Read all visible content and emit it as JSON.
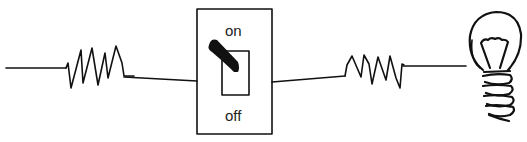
{
  "diagram": {
    "type": "circuit",
    "colors": {
      "line": "#111111",
      "text": "#222222",
      "background": "#ffffff"
    },
    "components": [
      {
        "id": "wire-left",
        "kind": "wire"
      },
      {
        "id": "resistor-1",
        "kind": "resistor"
      },
      {
        "id": "switch",
        "kind": "toggle-switch",
        "state": "on"
      },
      {
        "id": "resistor-2",
        "kind": "resistor"
      },
      {
        "id": "bulb",
        "kind": "light-bulb"
      }
    ],
    "switch": {
      "on_label": "on",
      "off_label": "off"
    }
  }
}
